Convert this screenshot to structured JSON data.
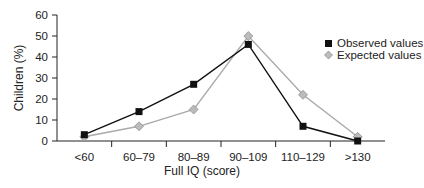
{
  "chart_data": {
    "type": "line",
    "title": "",
    "xlabel": "Full IQ (score)",
    "ylabel": "Children (%)",
    "categories": [
      "<60",
      "60–79",
      "80–89",
      "90–109",
      "110–129",
      ">130"
    ],
    "ylim": [
      0,
      60
    ],
    "yticks": [
      0,
      10,
      20,
      30,
      40,
      50,
      60
    ],
    "grid": false,
    "legend_position": "upper right",
    "series": [
      {
        "name": "Observed values",
        "marker": "square",
        "color": "#111111",
        "values": [
          3,
          14,
          27,
          46,
          7,
          0
        ]
      },
      {
        "name": "Expected values",
        "marker": "diamond",
        "color": "#aaaaaa",
        "values": [
          2,
          7,
          15,
          50,
          22,
          2
        ]
      }
    ]
  }
}
